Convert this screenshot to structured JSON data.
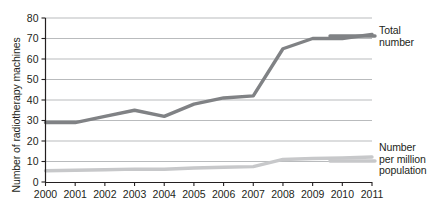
{
  "chart_data": {
    "type": "line",
    "title": "",
    "xlabel": "",
    "ylabel": "Number of radiotherapy machines",
    "x": [
      2000,
      2001,
      2002,
      2003,
      2004,
      2005,
      2006,
      2007,
      2008,
      2009,
      2010,
      2011
    ],
    "categories": [
      "2000",
      "2001",
      "2002",
      "2003",
      "2004",
      "2005",
      "2006",
      "2007",
      "2008",
      "2009",
      "2010",
      "2011"
    ],
    "ylim": [
      0,
      80
    ],
    "yticks": [
      0,
      10,
      20,
      30,
      40,
      50,
      60,
      70,
      80
    ],
    "ytick_labels": [
      "0",
      "10",
      "20",
      "30",
      "40",
      "50",
      "60",
      "70",
      "80"
    ],
    "grid": true,
    "legend_position": "right",
    "series": [
      {
        "name": "Total number",
        "label_text": "Total\nnumber",
        "color": "#808285",
        "values": [
          29,
          29,
          32,
          35,
          32,
          38,
          41,
          42,
          65,
          70,
          70,
          72
        ]
      },
      {
        "name": "Number per million population",
        "label_text": "Number\nper million\npopulation",
        "color": "#c7c8ca",
        "values": [
          5.5,
          5.7,
          6,
          6.3,
          6.2,
          6.8,
          7.2,
          7.5,
          11,
          11.5,
          11.7,
          12.2
        ]
      }
    ]
  },
  "axis": {
    "y_title": "Number of radiotherapy machines",
    "axis_color": "#231f20",
    "grid_color": "#a7a9ac"
  }
}
